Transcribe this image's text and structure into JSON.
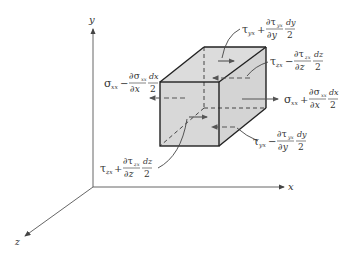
{
  "figure": {
    "axes": {
      "x_label": "x",
      "y_label": "y",
      "z_label": "z"
    },
    "labels": {
      "sigma_minus": {
        "base": "σ",
        "sub": "xx",
        "op": "−",
        "num": "∂σ",
        "num_sub": "xx",
        "den": "∂x",
        "frac2_num": "dx",
        "frac2_den": "2"
      },
      "sigma_plus": {
        "base": "σ",
        "sub": "xx",
        "op": "+",
        "num": "∂σ",
        "num_sub": "xx",
        "den": "∂x",
        "frac2_num": "dx",
        "frac2_den": "2"
      },
      "tau_yx_plus": {
        "base": "τ",
        "sub": "yx",
        "op": "+",
        "num": "∂τ",
        "num_sub": "yx",
        "den": "∂y",
        "frac2_num": "dy",
        "frac2_den": "2"
      },
      "tau_yx_minus": {
        "base": "τ",
        "sub": "yx",
        "op": "−",
        "num": "∂τ",
        "num_sub": "yx",
        "den": "∂y",
        "frac2_num": "dy",
        "frac2_den": "2"
      },
      "tau_zx_minus": {
        "base": "τ",
        "sub": "zx",
        "op": "−",
        "num": "∂τ",
        "num_sub": "zx",
        "den": "∂z",
        "frac2_num": "dz",
        "frac2_den": "2"
      },
      "tau_zx_plus": {
        "base": "τ",
        "sub": "zx",
        "op": "+",
        "num": "∂τ",
        "num_sub": "zx",
        "den": "∂z",
        "frac2_num": "dz",
        "frac2_den": "2"
      }
    },
    "colors": {
      "cube_fill": "#d9d9d9",
      "cube_edge": "#222222",
      "arrow": "#555555",
      "axis": "#444444"
    }
  }
}
